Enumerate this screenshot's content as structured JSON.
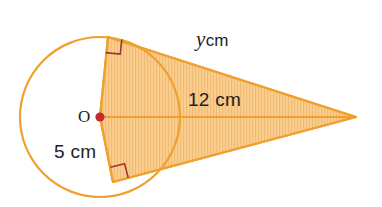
{
  "figure": {
    "type": "geometry-diagram",
    "width": 382,
    "height": 207,
    "background_color": "#FFFFFF"
  },
  "colors": {
    "stroke_orange": "#F0A02E",
    "fill_orange": "#F8CE93",
    "hatch_orange": "#F2B765",
    "center_dot_red": "#C42A2A",
    "right_angle_marker": "#A03535",
    "text_dark": "#221F1F"
  },
  "labels": {
    "center_point": "O",
    "radius": "5 cm",
    "distance_to_apex": "12 cm",
    "tangent_variable": "y",
    "tangent_unit": "cm",
    "tangent_full": "y cm"
  },
  "geometry": {
    "circle": {
      "center_x": 100,
      "center_y": 117,
      "radius_px": 80,
      "radius_label": "5 cm"
    },
    "apex": {
      "x": 356,
      "y": 117,
      "label": "apex"
    },
    "tangent_point_top": {
      "x": 108,
      "y": 37
    },
    "tangent_point_bottom": {
      "x": 113,
      "y": 182
    },
    "right_angles": [
      {
        "at": "tangent-point-top",
        "marker": "square",
        "degrees": 90
      },
      {
        "at": "tangent-point-bottom",
        "marker": "square",
        "degrees": 90
      }
    ],
    "segments": [
      {
        "name": "radius-to-top-tangent",
        "from": "O",
        "to": "tangent_point_top",
        "label": "5 cm"
      },
      {
        "name": "radius-to-bottom-tangent",
        "from": "O",
        "to": "tangent_point_bottom",
        "label": "5 cm"
      },
      {
        "name": "center-to-apex",
        "from": "O",
        "to": "apex",
        "label": "12 cm"
      },
      {
        "name": "upper-tangent",
        "from": "tangent_point_top",
        "to": "apex",
        "label": "y cm"
      },
      {
        "name": "lower-tangent",
        "from": "tangent_point_bottom",
        "to": "apex",
        "label": ""
      }
    ]
  }
}
